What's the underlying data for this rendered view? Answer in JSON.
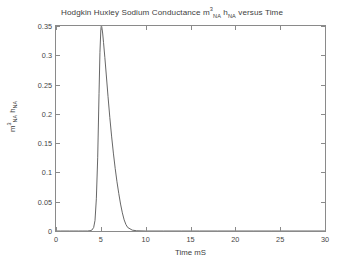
{
  "chart_data": {
    "type": "line",
    "title_parts": {
      "lead": "Hodgkin Huxley Sodium Conductance m",
      "sup1": "3",
      "sub1": "NA",
      "mid": " h",
      "sub2": "NA",
      "tail": " versus Time"
    },
    "xlabel": "Time mS",
    "ylabel": "m^3_NA h_NA",
    "ylabel_parts": {
      "lead": "m",
      "sup1": "3",
      "sub1": "NA",
      "mid": " h",
      "sub2": "NA"
    },
    "xlim": [
      0,
      30
    ],
    "ylim": [
      0,
      0.35
    ],
    "xticks": [
      0,
      5,
      10,
      15,
      20,
      25,
      30
    ],
    "xtick_labels": [
      "0",
      "5",
      "10",
      "15",
      "20",
      "25",
      "30"
    ],
    "yticks": [
      0,
      0.05,
      0.1,
      0.15,
      0.2,
      0.25,
      0.3,
      0.35
    ],
    "ytick_labels": [
      "0",
      "0.05",
      "0.1",
      "0.15",
      "0.2",
      "0.25",
      "0.3",
      "0.35"
    ],
    "grid": false,
    "legend": null,
    "line_color": "#555555",
    "series": [
      {
        "name": "m^3_NA h_NA",
        "x": [
          0,
          0.5,
          1.0,
          1.5,
          2.0,
          2.5,
          3.0,
          3.5,
          3.8,
          4.0,
          4.2,
          4.35,
          4.5,
          4.65,
          4.8,
          4.9,
          5.0,
          5.05,
          5.1,
          5.2,
          5.3,
          5.45,
          5.6,
          5.8,
          6.0,
          6.2,
          6.4,
          6.6,
          6.8,
          7.0,
          7.2,
          7.4,
          7.6,
          7.8,
          8.0,
          8.5,
          9.0,
          10.0,
          12.0,
          14.0,
          16.0,
          18.0,
          20.0,
          22.0,
          24.0,
          26.0,
          28.0,
          30.0
        ],
        "y": [
          0.0,
          0.0,
          0.0,
          0.0,
          0.0,
          0.0,
          0.0,
          0.0,
          0.0005,
          0.0015,
          0.006,
          0.018,
          0.055,
          0.125,
          0.235,
          0.305,
          0.344,
          0.35,
          0.349,
          0.338,
          0.322,
          0.296,
          0.268,
          0.23,
          0.194,
          0.162,
          0.133,
          0.107,
          0.084,
          0.064,
          0.046,
          0.031,
          0.019,
          0.011,
          0.006,
          0.0015,
          0.0004,
          0.0,
          0.0,
          0.0,
          0.0,
          0.0,
          0.0,
          0.0,
          0.0,
          0.0,
          0.0,
          0.0
        ],
        "peak_x": 5.05,
        "peak_y": 0.35
      }
    ]
  },
  "colors": {
    "background": "#ffffff",
    "axis": "#8a8a8a",
    "text": "#404040",
    "line": "#555555"
  }
}
